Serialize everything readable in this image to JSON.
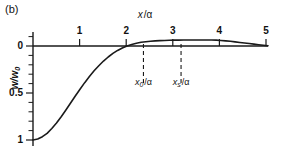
{
  "figure": {
    "panel_label": "(b)",
    "background_color": "#ffffff",
    "curve_color": "#1a1a1a",
    "axis_color": "#1a1a1a"
  },
  "axes": {
    "x_title_var": "x",
    "x_title_slash": "/",
    "x_title_unit": "α",
    "x_ticks": [
      "1",
      "2",
      "3",
      "4",
      "5"
    ],
    "y_title_var": "w",
    "y_title_slash": "/",
    "y_title_sub": "w",
    "y_title_subscript": "0",
    "y_ticks": [
      "0",
      "0.5",
      "1"
    ]
  },
  "annotations": {
    "marker_1": {
      "var": "x",
      "sub": "0",
      "slash": "/",
      "unit": "α",
      "x_value": 2.35
    },
    "marker_2": {
      "var": "x",
      "sub": "s",
      "slash": "/",
      "unit": "α",
      "x_value": 3.15
    }
  },
  "chart_data": {
    "type": "line",
    "title": "(b)",
    "xlabel": "x/α",
    "ylabel": "w/w0",
    "xlim": [
      0,
      5
    ],
    "ylim": [
      1.05,
      -0.12
    ],
    "y_inverted": true,
    "grid": false,
    "legend": null,
    "x_ticks": [
      1,
      2,
      3,
      4,
      5
    ],
    "y_ticks": [
      0,
      0.5,
      1
    ],
    "y_minor_tick_step": 0.1,
    "zero_crossing": 2.35,
    "peak_x": 3.7,
    "peak_y": -0.06,
    "vertical_dashed_lines": [
      {
        "label": "x0/α",
        "x": 2.35
      },
      {
        "label": "xs/α",
        "x": 3.15
      }
    ],
    "series": [
      {
        "name": "w/w0",
        "x": [
          0.0,
          0.1,
          0.2,
          0.3,
          0.4,
          0.5,
          0.6,
          0.7,
          0.8,
          0.9,
          1.0,
          1.1,
          1.2,
          1.3,
          1.4,
          1.5,
          1.6,
          1.7,
          1.8,
          1.9,
          2.0,
          2.1,
          2.2,
          2.3,
          2.35,
          2.4,
          2.5,
          2.6,
          2.7,
          2.8,
          2.9,
          3.0,
          3.1,
          3.2,
          3.3,
          3.4,
          3.5,
          3.6,
          3.7,
          3.8,
          3.9,
          4.0,
          4.1,
          4.2,
          4.3,
          4.4,
          4.5,
          4.6,
          4.7,
          4.8,
          4.9,
          5.0
        ],
        "y": [
          1.0,
          0.99,
          0.965,
          0.93,
          0.878,
          0.82,
          0.752,
          0.68,
          0.606,
          0.532,
          0.46,
          0.39,
          0.325,
          0.264,
          0.21,
          0.16,
          0.117,
          0.079,
          0.047,
          0.021,
          0.0,
          -0.017,
          -0.03,
          -0.039,
          -0.042,
          -0.045,
          -0.05,
          -0.054,
          -0.057,
          -0.059,
          -0.061,
          -0.062,
          -0.063,
          -0.0635,
          -0.064,
          -0.0642,
          -0.0643,
          -0.0642,
          -0.064,
          -0.0632,
          -0.062,
          -0.059,
          -0.055,
          -0.05,
          -0.044,
          -0.038,
          -0.032,
          -0.026,
          -0.02,
          -0.014,
          -0.008,
          -0.003
        ]
      }
    ]
  }
}
